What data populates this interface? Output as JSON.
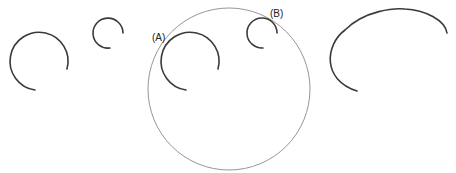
{
  "labels": {
    "a": "(A)",
    "b": "(B)"
  },
  "colors": {
    "arc_stroke": "#3a3a3a",
    "circle_stroke": "#8a8a8a",
    "background": "#ffffff"
  },
  "shapes": [
    {
      "name": "arc-left-large",
      "type": "arc"
    },
    {
      "name": "arc-left-small",
      "type": "arc"
    },
    {
      "name": "enclosing-circle",
      "type": "circle"
    },
    {
      "name": "arc-a",
      "type": "arc",
      "label": "(A)"
    },
    {
      "name": "arc-b",
      "type": "arc",
      "label": "(B)"
    },
    {
      "name": "arc-right-large",
      "type": "arc"
    }
  ]
}
